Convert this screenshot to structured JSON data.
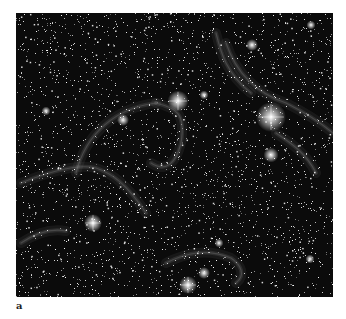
{
  "figure": {
    "caption_label": "a",
    "background_color": "#0b0b0b",
    "bright_stars": [
      {
        "x": 255,
        "y": 104,
        "r": 5
      },
      {
        "x": 162,
        "y": 88,
        "r": 3.5
      },
      {
        "x": 255,
        "y": 142,
        "r": 2.5
      },
      {
        "x": 77,
        "y": 210,
        "r": 3
      },
      {
        "x": 172,
        "y": 272,
        "r": 3
      },
      {
        "x": 188,
        "y": 260,
        "r": 2
      },
      {
        "x": 107,
        "y": 107,
        "r": 2
      },
      {
        "x": 236,
        "y": 32,
        "r": 2
      },
      {
        "x": 295,
        "y": 12,
        "r": 1.5
      },
      {
        "x": 203,
        "y": 230,
        "r": 1.5
      },
      {
        "x": 294,
        "y": 246,
        "r": 1.5
      },
      {
        "x": 30,
        "y": 98,
        "r": 1.5
      },
      {
        "x": 188,
        "y": 82,
        "r": 1.5
      }
    ],
    "filaments": [
      "M5 170 C30 160 60 150 80 155 C95 160 110 170 130 200",
      "M60 160 C70 120 100 95 140 90",
      "M140 90 C160 95 170 100 165 130 C160 150 150 160 135 150",
      "M210 30 C220 60 240 80 270 90 C290 100 305 110 317 120",
      "M200 20 C205 40 210 60 235 80",
      "M150 250 C170 240 190 235 215 245 C225 252 230 262 220 270",
      "M5 230 C20 220 35 215 50 218",
      "M260 120 C275 130 290 140 300 160"
    ],
    "star_count": 2600,
    "seed": 7
  }
}
